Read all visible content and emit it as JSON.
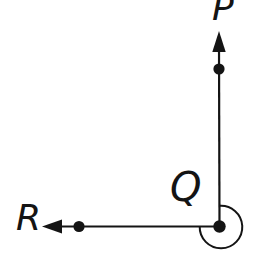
{
  "diagram": {
    "type": "geometry-angle-figure",
    "labels": {
      "p": "P",
      "q": "Q",
      "r": "R"
    },
    "elements": {
      "rays": [
        "ray QP pointing upward with marked point",
        "ray QR pointing leftward with marked point"
      ],
      "vertex": "Q",
      "angle_marker": "reflex arc around vertex Q (about 270 degrees)"
    },
    "colors": {
      "background": "#ffffff",
      "ink": "#141414"
    }
  }
}
